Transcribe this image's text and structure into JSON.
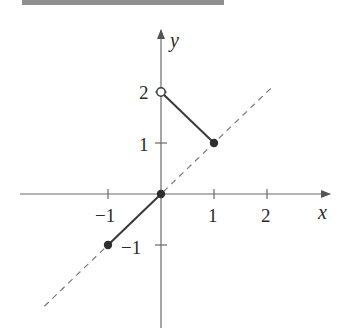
{
  "chart_data": {
    "type": "line",
    "title": "",
    "xlabel": "x",
    "ylabel": "y",
    "xlim": [
      -2.6,
      3.2
    ],
    "ylim": [
      -2.6,
      3.2
    ],
    "grid": false,
    "x_ticks": [
      -1,
      1,
      2
    ],
    "x_tick_labels": [
      "−1",
      "1",
      "2"
    ],
    "y_ticks": [
      -1,
      1,
      2
    ],
    "y_tick_labels": [
      "−1",
      "1",
      "2"
    ],
    "series": [
      {
        "name": "segment-1",
        "style": "solid",
        "points": [
          [
            -1,
            -1
          ],
          [
            0,
            0
          ]
        ],
        "endpoints": [
          {
            "x": -1,
            "y": -1,
            "marker": "closed"
          },
          {
            "x": 0,
            "y": 0,
            "marker": "closed"
          }
        ]
      },
      {
        "name": "segment-2",
        "style": "solid",
        "points": [
          [
            0,
            2
          ],
          [
            1,
            1
          ]
        ],
        "endpoints": [
          {
            "x": 0,
            "y": 2,
            "marker": "open"
          },
          {
            "x": 1,
            "y": 1,
            "marker": "closed"
          }
        ]
      },
      {
        "name": "y = x reference",
        "style": "dashed",
        "points": [
          [
            -2.2,
            -2.2
          ],
          [
            2.1,
            2.1
          ]
        ]
      }
    ]
  },
  "header": {
    "bar_color": "#8f8f8f"
  },
  "labels": {
    "x_axis": "x",
    "y_axis": "y",
    "x_ticks": [
      "−1",
      "1",
      "2"
    ],
    "y_ticks": [
      "2",
      "1",
      "−1"
    ]
  }
}
